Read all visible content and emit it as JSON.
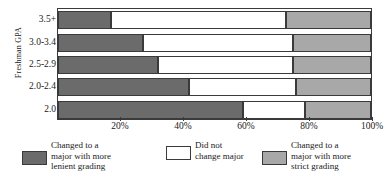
{
  "chart_data": {
    "type": "bar",
    "orientation": "horizontal",
    "stacked": true,
    "stack_mode": "percent",
    "title": "",
    "xlabel": "",
    "ylabel": "Freshman GPA",
    "grid": false,
    "legend_position": "bottom",
    "xlim": [
      0,
      100
    ],
    "xticks": [
      20,
      40,
      60,
      80,
      100
    ],
    "xticklabels": [
      "20%",
      "40%",
      "60%",
      "80%",
      "100%"
    ],
    "categories": [
      "3.5+",
      "3.0-3.4",
      "2.5-2.9",
      "2.0-2.4",
      "2.0"
    ],
    "series": [
      {
        "name": "Changed to a major with more lenient grading",
        "legend_label": "Changed to a\nmajor with more\nlenient grading",
        "color": "#6b6b6b",
        "values": [
          17,
          27,
          32,
          42,
          59
        ]
      },
      {
        "name": "Did not change major",
        "legend_label": "Did not\nchange major",
        "color": "#ffffff",
        "values": [
          56,
          48,
          43,
          34,
          20
        ]
      },
      {
        "name": "Changed to a major with more strict grading",
        "legend_label": "Changed to a\nmajor with more\nstrict grading",
        "color": "#a8a8a8",
        "values": [
          27,
          25,
          25,
          24,
          21
        ]
      }
    ]
  },
  "axes": {
    "y_axis_title": "Freshman GPA",
    "category_labels": [
      "3.5+",
      "3.0-3.4",
      "2.5-2.9",
      "2.0-2.4",
      "2.0"
    ],
    "x_tick_labels": [
      "20%",
      "40%",
      "60%",
      "80%",
      "100%"
    ]
  },
  "legend": {
    "items": [
      {
        "label": "Changed to a\nmajor with more\nlenient grading",
        "color": "#6b6b6b"
      },
      {
        "label": "Did not\nchange major",
        "color": "#ffffff"
      },
      {
        "label": "Changed to a\nmajor with more\nstrict grading",
        "color": "#a8a8a8"
      }
    ]
  },
  "colors": {
    "lenient": "#6b6b6b",
    "no_change": "#ffffff",
    "strict": "#a8a8a8",
    "outline": "#3a3a3a",
    "background": "#ffffff"
  }
}
